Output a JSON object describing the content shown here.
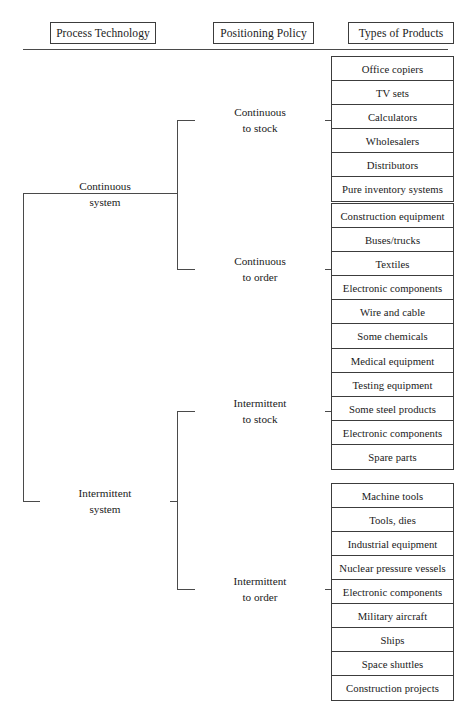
{
  "headers": {
    "process_technology": "Process Technology",
    "positioning_policy": "Positioning Policy",
    "types_of_products": "Types of Products"
  },
  "process_technology": [
    {
      "line1": "Continuous",
      "line2": "system"
    },
    {
      "line1": "Intermittent",
      "line2": "system"
    }
  ],
  "positioning_policy": [
    {
      "line1": "Continuous",
      "line2": "to stock"
    },
    {
      "line1": "Continuous",
      "line2": "to order"
    },
    {
      "line1": "Intermittent",
      "line2": "to stock"
    },
    {
      "line1": "Intermittent",
      "line2": "to order"
    }
  ],
  "product_groups": [
    {
      "policy": "Continuous to stock",
      "items": [
        "Office copiers",
        "TV sets",
        "Calculators",
        "Wholesalers",
        "Distributors",
        "Pure inventory systems"
      ]
    },
    {
      "policy": "Continuous to order",
      "items": [
        "Construction equipment",
        "Buses/trucks",
        "Textiles",
        "Electronic components",
        "Wire and cable",
        "Some chemicals"
      ]
    },
    {
      "policy": "Intermittent to stock",
      "items": [
        "Medical equipment",
        "Testing equipment",
        "Some steel products",
        "Electronic components",
        "Spare parts"
      ]
    },
    {
      "policy": "Intermittent to order",
      "items": [
        "Machine tools",
        "Tools, dies",
        "Industrial equipment",
        "Nuclear pressure vessels",
        "Electronic components",
        "Military aircraft",
        "Ships",
        "Space shuttles",
        "Construction projects"
      ]
    }
  ],
  "colors": {
    "line": "#4a4a4a",
    "box_border": "#3c3c3c",
    "background": "#ffffff",
    "text": "#1a1a1a"
  }
}
